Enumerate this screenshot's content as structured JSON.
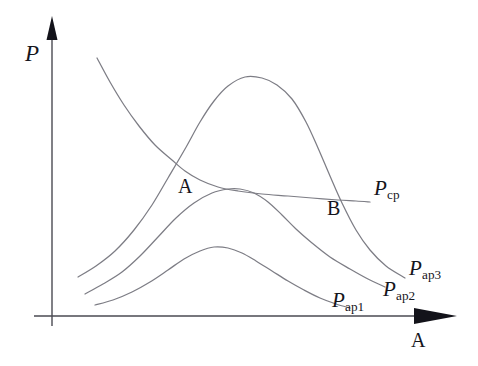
{
  "figure": {
    "title_visible": false,
    "background_color": "#ffffff",
    "curve_color": "#7d7d85",
    "axis_color": "#4a4a52",
    "text_color": "#15151c"
  },
  "axes": {
    "y_label": "P",
    "x_label": "A",
    "origin": {
      "x": 52,
      "y": 316
    },
    "y_top": {
      "x": 52,
      "y": 18
    },
    "x_right": {
      "x": 455,
      "y": 316
    },
    "y_arrow": "arrow-up",
    "x_arrow": "arrow-right"
  },
  "points": [
    {
      "name": "A",
      "label": "A",
      "x": 185,
      "y": 171,
      "label_x": 178,
      "label_y": 176
    },
    {
      "name": "B",
      "label": "B",
      "x": 332,
      "y": 200,
      "label_x": 327,
      "label_y": 198
    }
  ],
  "curve_labels": [
    {
      "id": "pcp",
      "base": "P",
      "sub": "cp",
      "x": 374,
      "y": 178
    },
    {
      "id": "pap3",
      "base": "P",
      "sub": "ap3",
      "x": 409,
      "y": 258
    },
    {
      "id": "pap2",
      "base": "P",
      "sub": "ap2",
      "x": 383,
      "y": 279
    },
    {
      "id": "pap1",
      "base": "P",
      "sub": "ap1",
      "x": 332,
      "y": 290
    }
  ],
  "chart_data": {
    "type": "line",
    "title": "",
    "xlabel": "A",
    "ylabel": "P",
    "grid": false,
    "legend": "inline-curve-labels",
    "axis_note": "Unlabeled qualitative axes; values are schematic pixel-traced coordinates",
    "xlim": [
      52,
      455
    ],
    "ylim": [
      316,
      18
    ],
    "series": [
      {
        "name": "P_cp",
        "label": "Pcp",
        "description": "Monotonically decreasing convex cost-of-power curve",
        "points": [
          [
            97,
            58
          ],
          [
            110,
            82
          ],
          [
            124,
            105
          ],
          [
            139,
            126
          ],
          [
            155,
            145
          ],
          [
            172,
            160
          ],
          [
            185,
            171
          ],
          [
            200,
            180
          ],
          [
            218,
            187
          ],
          [
            238,
            191
          ],
          [
            262,
            194
          ],
          [
            288,
            196
          ],
          [
            312,
            198
          ],
          [
            338,
            200
          ],
          [
            356,
            201
          ],
          [
            370,
            202
          ]
        ]
      },
      {
        "name": "P_ap3",
        "label": "Pap3",
        "description": "Tallest bell-shaped curve, peaks well above the Pcp curve",
        "points": [
          [
            78,
            277
          ],
          [
            96,
            266
          ],
          [
            115,
            251
          ],
          [
            134,
            230
          ],
          [
            152,
            205
          ],
          [
            168,
            178
          ],
          [
            185,
            149
          ],
          [
            200,
            122
          ],
          [
            214,
            101
          ],
          [
            228,
            86
          ],
          [
            245,
            77
          ],
          [
            262,
            78
          ],
          [
            277,
            85
          ],
          [
            292,
            99
          ],
          [
            306,
            122
          ],
          [
            318,
            148
          ],
          [
            330,
            176
          ],
          [
            342,
            203
          ],
          [
            356,
            230
          ],
          [
            370,
            250
          ],
          [
            386,
            266
          ],
          [
            405,
            278
          ]
        ]
      },
      {
        "name": "P_ap2",
        "label": "Pap2",
        "description": "Middle bell curve whose peak just grazes the Pcp curve",
        "points": [
          [
            85,
            294
          ],
          [
            103,
            284
          ],
          [
            122,
            272
          ],
          [
            140,
            256
          ],
          [
            158,
            237
          ],
          [
            176,
            218
          ],
          [
            194,
            203
          ],
          [
            212,
            193
          ],
          [
            228,
            189
          ],
          [
            240,
            189
          ],
          [
            254,
            193
          ],
          [
            268,
            202
          ],
          [
            282,
            215
          ],
          [
            296,
            229
          ],
          [
            312,
            243
          ],
          [
            330,
            257
          ],
          [
            350,
            269
          ],
          [
            368,
            279
          ],
          [
            385,
            287
          ]
        ]
      },
      {
        "name": "P_ap1",
        "label": "Pap1",
        "description": "Lowest, flattest bell curve",
        "points": [
          [
            95,
            305
          ],
          [
            113,
            300
          ],
          [
            132,
            292
          ],
          [
            150,
            282
          ],
          [
            168,
            270
          ],
          [
            184,
            259
          ],
          [
            200,
            251
          ],
          [
            214,
            247
          ],
          [
            228,
            248
          ],
          [
            242,
            253
          ],
          [
            256,
            261
          ],
          [
            272,
            271
          ],
          [
            288,
            281
          ],
          [
            304,
            290
          ],
          [
            320,
            298
          ],
          [
            336,
            304
          ],
          [
            350,
            308
          ]
        ]
      }
    ]
  }
}
